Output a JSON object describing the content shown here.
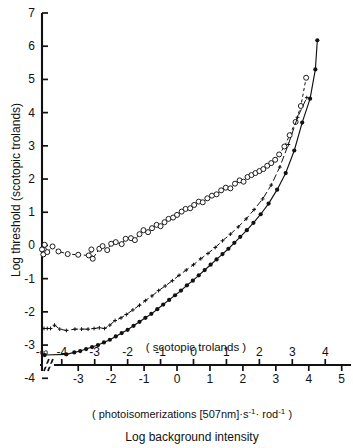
{
  "figure": {
    "y_axis_title": "Log threshold (scotopic trolands)",
    "x_axis_title_top": "( scotopic   trolands )",
    "x_axis_title_mid": "( photoisomerizations  [507nm]·s",
    "x_axis_exp1": "-1",
    "x_axis_mid_2": "· rod",
    "x_axis_exp2": "-1",
    "x_axis_mid_3": " )",
    "x_axis_title_bottom": "Log  background  intensity",
    "break_symbol": "//",
    "neg_infinity_label": "-∞"
  },
  "chart_data": {
    "type": "scatter",
    "title": "",
    "xlabel": "Log background intensity ( scotopic trolands )",
    "ylabel": "Log threshold (scotopic trolands)",
    "xlim": [
      -4.6,
      4.6
    ],
    "ylim": [
      -4.4,
      7.0
    ],
    "grid": false,
    "legend": "none",
    "axis_break": {
      "after_tick": "-∞",
      "symbol": "//",
      "x_position": -4.45
    },
    "x_ticks_top": [
      "-∞",
      "-4",
      "-3",
      "-2",
      "-1",
      "0",
      "1",
      "2",
      "3",
      "4"
    ],
    "x_ticks_top_values": [
      -4.6,
      -4,
      -3,
      -2,
      -1,
      0,
      1,
      2,
      3,
      4
    ],
    "x_ticks_bottom": [
      "-3",
      "-2",
      "-1",
      "0",
      "1",
      "2",
      "3",
      "4",
      "5"
    ],
    "x_ticks_bottom_values": [
      -3.5,
      -2.5,
      -1.5,
      -0.5,
      0.5,
      1.5,
      2.5,
      3.5,
      4.5
    ],
    "x_tick_top_units": "scotopic trolands",
    "x_tick_bottom_units": "photoisomerizations [507nm]·s-1·rod-1",
    "y_ticks": [
      -4,
      -3,
      -2,
      -1,
      0,
      1,
      2,
      3,
      4,
      5,
      6,
      7
    ],
    "series": [
      {
        "name": "open-circles",
        "marker": "open-circle",
        "line": "dashed",
        "points": [
          [
            -4.6,
            -0.12
          ],
          [
            -4.56,
            -0.27
          ],
          [
            -4.52,
            0.02
          ],
          [
            -4.44,
            -0.2
          ],
          [
            -4.28,
            -0.03
          ],
          [
            -4.1,
            -0.18
          ],
          [
            -3.82,
            -0.26
          ],
          [
            -3.5,
            -0.28
          ],
          [
            -3.18,
            -0.3
          ],
          [
            -3.1,
            -0.12
          ],
          [
            -3.06,
            -0.4
          ],
          [
            -2.86,
            -0.1
          ],
          [
            -2.76,
            -0.02
          ],
          [
            -2.62,
            -0.14
          ],
          [
            -2.5,
            0.05
          ],
          [
            -2.36,
            0.1
          ],
          [
            -2.18,
            0.04
          ],
          [
            -2.06,
            0.2
          ],
          [
            -1.9,
            0.22
          ],
          [
            -1.78,
            0.16
          ],
          [
            -1.64,
            0.34
          ],
          [
            -1.52,
            0.46
          ],
          [
            -1.38,
            0.4
          ],
          [
            -1.26,
            0.52
          ],
          [
            -1.12,
            0.62
          ],
          [
            -1.0,
            0.58
          ],
          [
            -0.88,
            0.7
          ],
          [
            -0.76,
            0.8
          ],
          [
            -0.62,
            0.84
          ],
          [
            -0.5,
            0.92
          ],
          [
            -0.36,
            1.02
          ],
          [
            -0.24,
            1.1
          ],
          [
            -0.1,
            1.12
          ],
          [
            0.02,
            1.22
          ],
          [
            0.16,
            1.32
          ],
          [
            0.28,
            1.3
          ],
          [
            0.42,
            1.42
          ],
          [
            0.56,
            1.5
          ],
          [
            0.7,
            1.54
          ],
          [
            0.84,
            1.66
          ],
          [
            0.98,
            1.74
          ],
          [
            1.12,
            1.72
          ],
          [
            1.26,
            1.86
          ],
          [
            1.4,
            1.96
          ],
          [
            1.52,
            1.92
          ],
          [
            1.64,
            2.06
          ],
          [
            1.76,
            2.12
          ],
          [
            1.88,
            2.18
          ],
          [
            2.0,
            2.24
          ],
          [
            2.12,
            2.3
          ],
          [
            2.24,
            2.4
          ],
          [
            2.36,
            2.48
          ],
          [
            2.48,
            2.58
          ],
          [
            2.6,
            2.74
          ],
          [
            2.76,
            2.98
          ],
          [
            2.92,
            3.32
          ],
          [
            3.1,
            3.72
          ],
          [
            3.26,
            4.2
          ],
          [
            3.42,
            5.05
          ]
        ]
      },
      {
        "name": "small-crosses",
        "marker": "plus",
        "line": "dash-dot",
        "points": [
          [
            -4.54,
            -2.5
          ],
          [
            -4.44,
            -2.5
          ],
          [
            -4.34,
            -2.5
          ],
          [
            -4.22,
            -2.4
          ],
          [
            -4.06,
            -2.52
          ],
          [
            -3.86,
            -2.56
          ],
          [
            -3.6,
            -2.52
          ],
          [
            -3.4,
            -2.52
          ],
          [
            -3.2,
            -2.52
          ],
          [
            -3.02,
            -2.5
          ],
          [
            -2.86,
            -2.48
          ],
          [
            -2.7,
            -2.5
          ],
          [
            -2.54,
            -2.4
          ],
          [
            -2.38,
            -2.26
          ],
          [
            -2.2,
            -2.18
          ],
          [
            -2.04,
            -2.08
          ],
          [
            -1.84,
            -1.94
          ],
          [
            -1.64,
            -1.8
          ],
          [
            -1.46,
            -1.66
          ],
          [
            -1.26,
            -1.52
          ],
          [
            -1.06,
            -1.36
          ],
          [
            -0.86,
            -1.22
          ],
          [
            -0.64,
            -1.06
          ],
          [
            -0.44,
            -0.9
          ],
          [
            -0.22,
            -0.74
          ],
          [
            0.0,
            -0.58
          ],
          [
            0.22,
            -0.4
          ],
          [
            0.44,
            -0.24
          ],
          [
            0.66,
            -0.06
          ],
          [
            0.88,
            0.14
          ],
          [
            1.12,
            0.34
          ],
          [
            1.36,
            0.56
          ],
          [
            1.6,
            0.8
          ],
          [
            1.84,
            1.08
          ],
          [
            2.1,
            1.4
          ],
          [
            2.36,
            1.82
          ],
          [
            2.62,
            2.36
          ],
          [
            2.88,
            3.04
          ],
          [
            3.16,
            3.86
          ],
          [
            3.44,
            4.45
          ]
        ]
      },
      {
        "name": "filled-circles",
        "marker": "filled-circle",
        "line": "solid",
        "points": [
          [
            -4.52,
            -3.3
          ],
          [
            -3.86,
            -3.28
          ],
          [
            -3.62,
            -3.22
          ],
          [
            -3.44,
            -3.18
          ],
          [
            -3.26,
            -3.12
          ],
          [
            -3.08,
            -3.06
          ],
          [
            -2.9,
            -3.0
          ],
          [
            -2.72,
            -2.92
          ],
          [
            -2.54,
            -2.84
          ],
          [
            -2.36,
            -2.74
          ],
          [
            -2.18,
            -2.64
          ],
          [
            -2.0,
            -2.54
          ],
          [
            -1.82,
            -2.42
          ],
          [
            -1.64,
            -2.3
          ],
          [
            -1.46,
            -2.18
          ],
          [
            -1.28,
            -2.06
          ],
          [
            -1.1,
            -1.92
          ],
          [
            -0.92,
            -1.78
          ],
          [
            -0.74,
            -1.64
          ],
          [
            -0.56,
            -1.5
          ],
          [
            -0.38,
            -1.36
          ],
          [
            -0.2,
            -1.2
          ],
          [
            -0.02,
            -1.06
          ],
          [
            0.16,
            -0.9
          ],
          [
            0.34,
            -0.74
          ],
          [
            0.52,
            -0.58
          ],
          [
            0.7,
            -0.42
          ],
          [
            0.88,
            -0.26
          ],
          [
            1.06,
            -0.1
          ],
          [
            1.24,
            0.08
          ],
          [
            1.42,
            0.26
          ],
          [
            1.62,
            0.46
          ],
          [
            1.82,
            0.68
          ],
          [
            2.04,
            0.94
          ],
          [
            2.28,
            1.26
          ],
          [
            2.54,
            1.68
          ],
          [
            2.8,
            2.18
          ],
          [
            3.06,
            2.86
          ],
          [
            3.3,
            3.7
          ],
          [
            3.54,
            4.42
          ],
          [
            3.7,
            5.3
          ],
          [
            3.76,
            6.18
          ]
        ]
      }
    ]
  }
}
